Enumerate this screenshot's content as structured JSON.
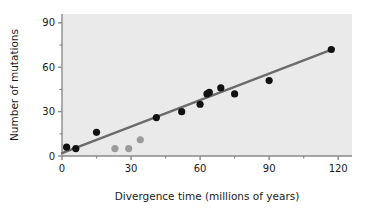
{
  "chart_data": {
    "type": "scatter",
    "title": "",
    "xlabel": "Divergence time (millions of years)",
    "ylabel": "Number of mutations",
    "xlim": [
      0,
      126
    ],
    "ylim": [
      0,
      96
    ],
    "xticks": [
      0,
      30,
      60,
      90,
      120
    ],
    "xticklabels": [
      "0",
      "30",
      "60",
      "90",
      "120"
    ],
    "xminorticks": [
      15,
      45,
      75,
      105
    ],
    "yticks": [
      0,
      30,
      60,
      90
    ],
    "yticklabels": [
      "0",
      "30",
      "60",
      "90"
    ],
    "yminorticks": [
      15,
      45,
      75
    ],
    "grid": false,
    "legend": "none",
    "plot_background": "#eaeaea",
    "series": [
      {
        "name": "primary-samples",
        "marker": "circle",
        "color": "#111111",
        "points": [
          {
            "x": 2,
            "y": 6
          },
          {
            "x": 6,
            "y": 5
          },
          {
            "x": 15,
            "y": 16
          },
          {
            "x": 41,
            "y": 26
          },
          {
            "x": 52,
            "y": 30
          },
          {
            "x": 60,
            "y": 35
          },
          {
            "x": 63,
            "y": 42
          },
          {
            "x": 64,
            "y": 43
          },
          {
            "x": 69,
            "y": 46
          },
          {
            "x": 75,
            "y": 42
          },
          {
            "x": 90,
            "y": 51
          },
          {
            "x": 117,
            "y": 72
          }
        ]
      },
      {
        "name": "outlier-samples",
        "marker": "circle",
        "color": "#9b9b9b",
        "points": [
          {
            "x": 23,
            "y": 5
          },
          {
            "x": 29,
            "y": 5
          },
          {
            "x": 34,
            "y": 11
          }
        ]
      }
    ],
    "trendline": {
      "name": "regression-line",
      "color": "#6b6b6b",
      "x0": 0,
      "y0": 2,
      "x1": 118,
      "y1": 72.5
    }
  }
}
